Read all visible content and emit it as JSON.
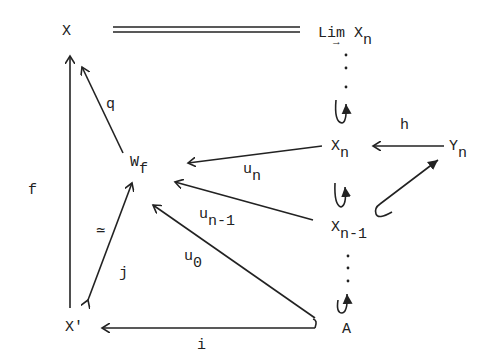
{
  "nodes": {
    "X": {
      "main": "X",
      "sub": ""
    },
    "lim": {
      "main": "Lim X",
      "sub": "n",
      "arrow_under": "→"
    },
    "Wf": {
      "main": "W",
      "sub": "f"
    },
    "Xn": {
      "main": "X",
      "sub": "n"
    },
    "Yn": {
      "main": "Y",
      "sub": "n"
    },
    "Xn1": {
      "main": "X",
      "sub": "n-1"
    },
    "Xprime": {
      "main": "X'",
      "sub": ""
    },
    "A": {
      "main": "A",
      "sub": ""
    }
  },
  "edges": {
    "f": "f",
    "q": "q",
    "h": "h",
    "un": "u",
    "un_sub": "n",
    "un1": "u",
    "un1_sub": "n-1",
    "u0": "u",
    "u0_sub": "0",
    "j": "j",
    "equiv": "≃",
    "i": "i"
  },
  "colors": {
    "ink": "#222222",
    "background": "#ffffff"
  }
}
